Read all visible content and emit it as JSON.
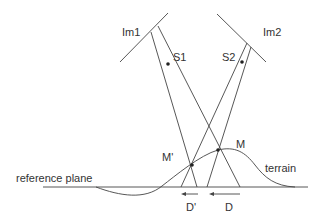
{
  "diagram": {
    "labels": {
      "im1": "Im1",
      "im2": "Im2",
      "s1": "S1",
      "s2": "S2",
      "m": "M",
      "m_prime": "M'",
      "terrain": "terrain",
      "reference_plane": "reference plane",
      "d": "D",
      "d_prime": "D'"
    },
    "colors": {
      "line": "#444444",
      "point": "#222222",
      "text": "#333333",
      "background": "#ffffff"
    }
  }
}
